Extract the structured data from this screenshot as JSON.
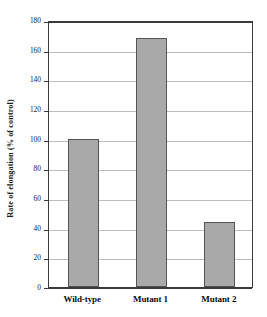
{
  "chart_data": {
    "type": "bar",
    "title": "",
    "xlabel": "",
    "ylabel": "Rate of elongation (% of control)",
    "categories": [
      "Wild-type",
      "Mutant 1",
      "Mutant 2"
    ],
    "values": [
      100,
      168,
      44
    ],
    "ylim": [
      0,
      180
    ],
    "yticks": [
      0,
      20,
      40,
      60,
      80,
      100,
      120,
      140,
      160,
      180
    ],
    "ytick_labels": [
      "0",
      "20",
      "40",
      "60",
      "80",
      "100",
      "120",
      "140",
      "160",
      "180"
    ],
    "grid": true,
    "legend": null,
    "bar_color": "#a9a9a9",
    "bar_edge_color": "#555555",
    "axis_color": "#3a3a3a",
    "grid_color": "#bdbdbd",
    "background": "#ffffff"
  }
}
